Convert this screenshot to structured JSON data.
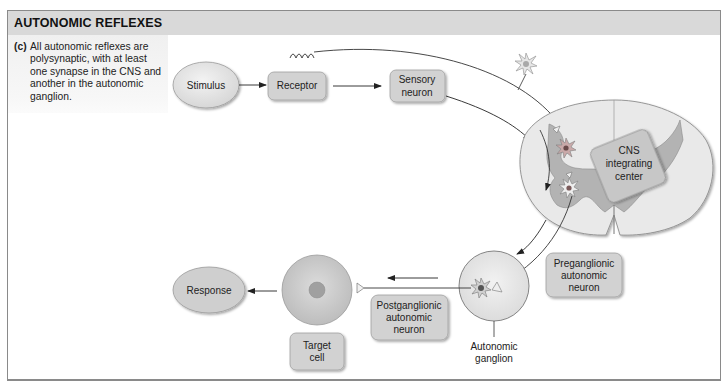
{
  "header": {
    "title": "AUTONOMIC REFLEXES"
  },
  "caption": {
    "label": "(c)",
    "text": "All autonomic reflexes are polysynaptic, with at least one synapse in the CNS and another in the autonomic ganglion."
  },
  "nodes": {
    "stimulus": "Stimulus",
    "receptor": "Receptor",
    "sensory_neuron": [
      "Sensory",
      "neuron"
    ],
    "cns_center": [
      "CNS",
      "integrating",
      "center"
    ],
    "preganglionic": [
      "Preganglionic",
      "autonomic",
      "neuron"
    ],
    "postganglionic": [
      "Postganglionic",
      "autonomic",
      "neuron"
    ],
    "target_cell": [
      "Target",
      "cell"
    ],
    "response": "Response",
    "autonomic_ganglion": [
      "Autonomic",
      "ganglion"
    ]
  },
  "colors": {
    "header_bg": "#d9d9d9",
    "box_fill": "#d4d4d4",
    "ellipse_fill": "#e4e4e4",
    "cord_white_matter": "#e9e9e9",
    "cord_gray_matter": "#b3b3b3",
    "cell_fill": "#cfcfcf",
    "line": "#333333"
  }
}
